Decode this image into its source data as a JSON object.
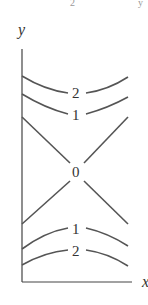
{
  "diagram": {
    "type": "level-curves",
    "axes": {
      "y_label": "y",
      "x_label": "x"
    },
    "top_fragments": [
      "2",
      "y"
    ],
    "curves": [
      {
        "level": "2",
        "position": "upper",
        "shape": "concave-up"
      },
      {
        "level": "1",
        "position": "upper",
        "shape": "concave-up"
      },
      {
        "level": "0",
        "position": "center",
        "shape": "crossing-lines"
      },
      {
        "level": "1",
        "position": "lower",
        "shape": "concave-down"
      },
      {
        "level": "2",
        "position": "lower",
        "shape": "concave-down"
      }
    ],
    "colors": {
      "stroke": "#555555",
      "text": "#333333"
    }
  }
}
